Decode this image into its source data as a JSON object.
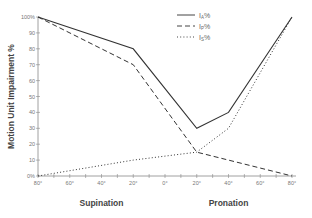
{
  "chart_data": {
    "type": "line",
    "title": "",
    "ylabel": "Motion Unit Impairment %",
    "xlabel_left": "Supination",
    "xlabel_right": "Pronation",
    "ylim": [
      0,
      100
    ],
    "x_ticks": [
      "80°",
      "60°",
      "40°",
      "20°",
      "0°",
      "20°",
      "40°",
      "60°",
      "80°"
    ],
    "y_ticks": [
      "0%",
      "10",
      "20",
      "30",
      "40",
      "50",
      "60",
      "70",
      "80",
      "90",
      "100%"
    ],
    "x": [
      -80,
      -20,
      20,
      40,
      80
    ],
    "series": [
      {
        "name": "I_A%",
        "style": "solid",
        "points": [
          [
            -80,
            100
          ],
          [
            -20,
            80
          ],
          [
            20,
            30
          ],
          [
            40,
            40
          ],
          [
            80,
            100
          ]
        ]
      },
      {
        "name": "I_P%",
        "style": "dashed",
        "points": [
          [
            -80,
            100
          ],
          [
            -20,
            70
          ],
          [
            20,
            15
          ],
          [
            80,
            0
          ]
        ]
      },
      {
        "name": "I_S%",
        "style": "dotted",
        "points": [
          [
            -80,
            0
          ],
          [
            -20,
            10
          ],
          [
            20,
            15
          ],
          [
            40,
            30
          ],
          [
            80,
            100
          ]
        ]
      }
    ],
    "legend": [
      {
        "label": "I",
        "sub": "A",
        "suffix": "%",
        "style": "solid"
      },
      {
        "label": "I",
        "sub": "P",
        "suffix": "%",
        "style": "dashed"
      },
      {
        "label": "I",
        "sub": "S",
        "suffix": "%",
        "style": "dotted"
      }
    ],
    "legend_position": "upper right",
    "grid": false
  }
}
